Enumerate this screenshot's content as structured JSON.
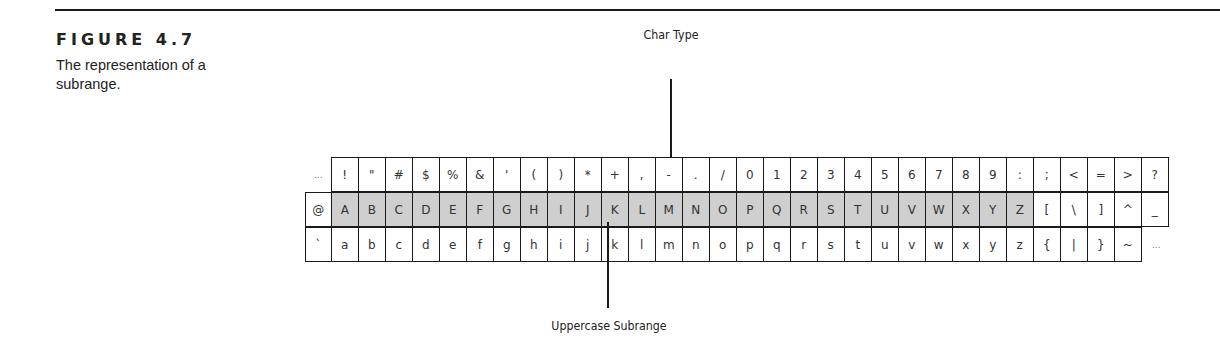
{
  "figure": {
    "label": "FIGURE 4.7",
    "caption": "The representation of a subrange."
  },
  "callouts": {
    "top_label": "Char Type",
    "bottom_label": "Uppercase Subrange"
  },
  "colors": {
    "shade": "#cfcfcf",
    "border": "#1a1a1a"
  },
  "grid": {
    "rows": [
      {
        "first": "...",
        "cells": [
          "!",
          "\"",
          "#",
          "$",
          "%",
          "&",
          "'",
          "(",
          ")",
          "*",
          "+",
          ",",
          "-",
          ".",
          "/",
          "0",
          "1",
          "2",
          "3",
          "4",
          "5",
          "6",
          "7",
          "8",
          "9",
          ":",
          ";",
          "<",
          "=",
          ">",
          "?"
        ]
      },
      {
        "first": "@",
        "cells": [
          "A",
          "B",
          "C",
          "D",
          "E",
          "F",
          "G",
          "H",
          "I",
          "J",
          "K",
          "L",
          "M",
          "N",
          "O",
          "P",
          "Q",
          "R",
          "S",
          "T",
          "U",
          "V",
          "W",
          "X",
          "Y",
          "Z",
          "[",
          "\\",
          "]",
          "^",
          "_"
        ]
      },
      {
        "first": "`",
        "cells": [
          "a",
          "b",
          "c",
          "d",
          "e",
          "f",
          "g",
          "h",
          "i",
          "j",
          "k",
          "l",
          "m",
          "n",
          "o",
          "p",
          "q",
          "r",
          "s",
          "t",
          "u",
          "v",
          "w",
          "x",
          "y",
          "z",
          "{",
          "|",
          "}",
          "~",
          "..."
        ]
      }
    ],
    "highlighted_subrange": {
      "row": 1,
      "from": "A",
      "to": "Z"
    }
  }
}
